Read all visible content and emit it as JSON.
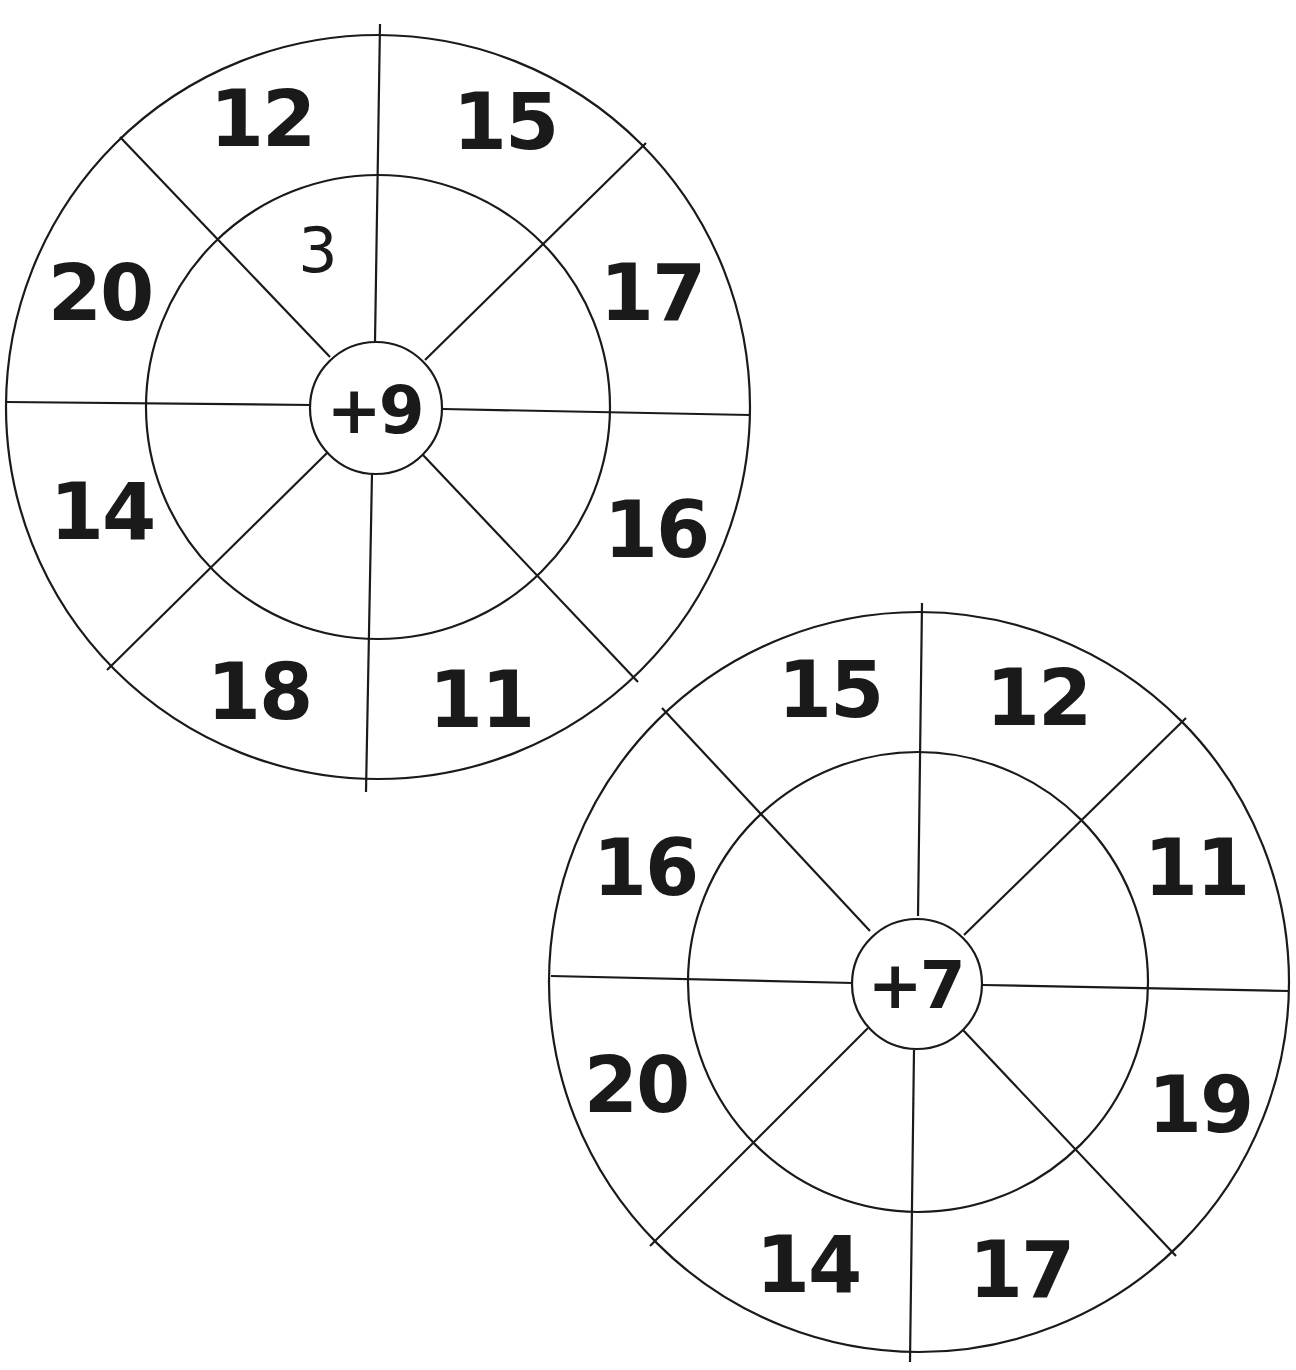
{
  "worksheet": {
    "wheels": [
      {
        "operation": "+9",
        "outer_numbers": {
          "top_left": "12",
          "top_right": "15",
          "right_upper": "17",
          "right_lower": "16",
          "bottom_right": "11",
          "bottom_left": "18",
          "left_lower": "14",
          "left_upper": "20"
        },
        "inner_answers": {
          "top_left": "3",
          "top_right": "",
          "right_upper": "",
          "right_lower": "",
          "bottom_right": "",
          "bottom_left": "",
          "left_lower": "",
          "left_upper": ""
        }
      },
      {
        "operation": "+7",
        "outer_numbers": {
          "top_left": "15",
          "top_right": "12",
          "right_upper": "11",
          "right_lower": "19",
          "bottom_right": "17",
          "bottom_left": "14",
          "left_lower": "20",
          "left_upper": "16"
        },
        "inner_answers": {
          "top_left": "",
          "top_right": "",
          "right_upper": "",
          "right_lower": "",
          "bottom_right": "",
          "bottom_left": "",
          "left_lower": "",
          "left_upper": ""
        }
      }
    ]
  }
}
